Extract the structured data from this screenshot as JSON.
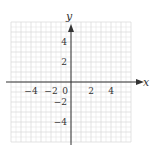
{
  "diagram": {
    "type": "coordinate-plane",
    "x_axis_label": "x",
    "y_axis_label": "y",
    "x_range": [
      -6,
      6
    ],
    "y_range": [
      -6,
      6
    ],
    "grid_step": 0.5,
    "x_ticks": [
      {
        "value": -4,
        "label": "−4"
      },
      {
        "value": -2,
        "label": "−2"
      },
      {
        "value": 0,
        "label": "0"
      },
      {
        "value": 2,
        "label": "2"
      },
      {
        "value": 4,
        "label": "4"
      }
    ],
    "y_ticks": [
      {
        "value": 4,
        "label": "4"
      },
      {
        "value": 2,
        "label": "2"
      },
      {
        "value": -2,
        "label": "−2"
      },
      {
        "value": -4,
        "label": "−4"
      }
    ],
    "colors": {
      "grid": "#dcdcdc",
      "axis": "#333333",
      "text": "#333333"
    }
  }
}
